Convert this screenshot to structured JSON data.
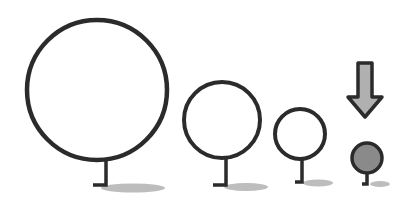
{
  "diagram": {
    "colors": {
      "stroke": "#2b2b2b",
      "circle_fill": "#ffffff",
      "selected_fill": "#8a8a8a",
      "arrow_fill": "#b0b0b0",
      "shadow": "#bdbdbd"
    },
    "pins": [
      {
        "id": "pin-xl",
        "cx": 97,
        "cy": 90,
        "r": 70,
        "stem_x": 106,
        "stem_bottom": 185,
        "foot_left": 93,
        "shadow": {
          "cx": 133,
          "cy": 188,
          "rx": 32,
          "ry": 4.5
        },
        "filled": false
      },
      {
        "id": "pin-lg",
        "cx": 222,
        "cy": 120,
        "r": 38,
        "stem_x": 226,
        "stem_bottom": 185,
        "foot_left": 213,
        "shadow": {
          "cx": 246,
          "cy": 187,
          "rx": 22,
          "ry": 4
        },
        "filled": false
      },
      {
        "id": "pin-md",
        "cx": 300,
        "cy": 134,
        "r": 25,
        "stem_x": 302,
        "stem_bottom": 182,
        "foot_left": 295,
        "shadow": {
          "cx": 318,
          "cy": 183,
          "rx": 15,
          "ry": 3.5
        },
        "filled": false
      },
      {
        "id": "pin-sm",
        "cx": 367,
        "cy": 158,
        "r": 15,
        "stem_x": 367,
        "stem_bottom": 184,
        "foot_left": 362,
        "shadow": {
          "cx": 380,
          "cy": 184,
          "rx": 10,
          "ry": 3
        },
        "filled": true
      }
    ],
    "arrow": {
      "direction": "down",
      "x": 365,
      "top": 63,
      "tip": 117
    }
  }
}
